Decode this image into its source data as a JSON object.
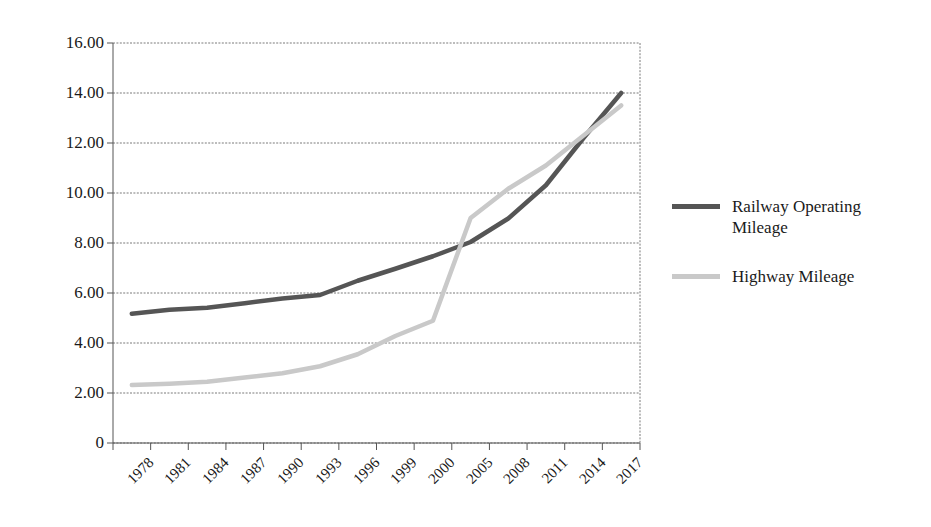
{
  "chart_data": {
    "type": "line",
    "title": "",
    "subtitle": "",
    "xlabel": "",
    "ylabel": "",
    "grid": true,
    "legend_position": "right",
    "x": [
      "1978",
      "1981",
      "1984",
      "1987",
      "1990",
      "1993",
      "1996",
      "1999",
      "2000",
      "2005",
      "2008",
      "2011",
      "2014",
      "2017"
    ],
    "categories": [
      "1978",
      "1981",
      "1984",
      "1987",
      "1990",
      "1993",
      "1996",
      "1999",
      "2000",
      "2005",
      "2008",
      "2011",
      "2014",
      "2017"
    ],
    "ylim": [
      0,
      16
    ],
    "ytick_labels": [
      "16.00",
      "14.00",
      "12.00",
      "10.00",
      "8.00",
      "6.00",
      "4.00",
      "2.00",
      "0"
    ],
    "ytick_values": [
      16,
      14,
      12,
      10,
      8,
      6,
      4,
      2,
      0
    ],
    "series": [
      {
        "name": "Railway Operating Mileage",
        "color": "#555555",
        "values": [
          5.17,
          5.33,
          5.41,
          5.59,
          5.78,
          5.92,
          6.49,
          6.97,
          7.47,
          8.04,
          8.98,
          10.31,
          12.2,
          14.0
        ]
      },
      {
        "name": "Highway Mileage",
        "color": "#c9c9c9",
        "values": [
          2.32,
          2.37,
          2.45,
          2.62,
          2.79,
          3.07,
          3.55,
          4.28,
          4.89,
          9.0,
          10.17,
          11.1,
          12.3,
          13.5
        ]
      }
    ]
  },
  "legend": {
    "entries": [
      {
        "label": "Railway Operating Mileage",
        "color": "#555555"
      },
      {
        "label": "Highway Mileage",
        "color": "#c9c9c9"
      }
    ]
  },
  "axes": {
    "y_labels": [
      "16.00",
      "14.00",
      "12.00",
      "10.00",
      "8.00",
      "6.00",
      "4.00",
      "2.00",
      "0"
    ],
    "x_labels": [
      "1978",
      "1981",
      "1984",
      "1987",
      "1990",
      "1993",
      "1996",
      "1999",
      "2000",
      "2005",
      "2008",
      "2011",
      "2014",
      "2017"
    ]
  },
  "colors": {
    "axis": "#555555",
    "gridline": "#7a7a7a",
    "series_railway": "#555555",
    "series_highway": "#c9c9c9",
    "background": "#ffffff",
    "text": "#1a1a1a"
  }
}
